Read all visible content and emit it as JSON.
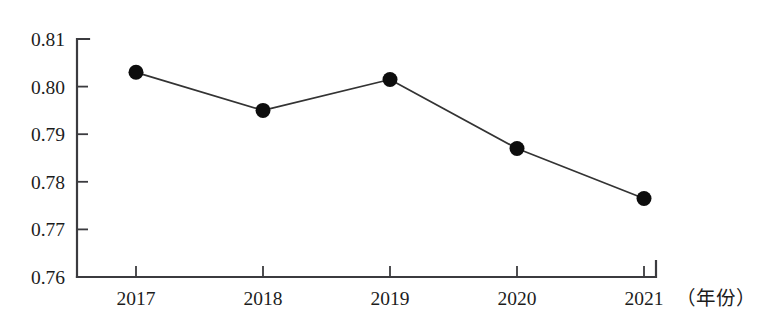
{
  "chart_data": {
    "type": "line",
    "title": "",
    "subtitle": "",
    "xlabel": "（年份）",
    "ylabel": "",
    "categories": [
      "2017",
      "2018",
      "2019",
      "2020",
      "2021"
    ],
    "values": [
      0.803,
      0.795,
      0.8015,
      0.787,
      0.7765
    ],
    "series": [
      {
        "name": "",
        "values": [
          0.803,
          0.795,
          0.8015,
          0.787,
          0.7765
        ]
      }
    ],
    "ylim": [
      0.76,
      0.81
    ],
    "xlim": [
      "2017",
      "2021"
    ],
    "ytick_labels": [
      "0.81",
      "0.80",
      "0.79",
      "0.78",
      "0.77",
      "0.76"
    ],
    "ytick_values": [
      0.81,
      0.8,
      0.79,
      0.78,
      0.77,
      0.76
    ],
    "xtick_labels": [
      "2017",
      "2018",
      "2019",
      "2020",
      "2021"
    ],
    "grid": false,
    "legend": false,
    "legend_position": "none",
    "marker": "filled-circle",
    "line_color": "#333333",
    "marker_color": "#0d0d0d",
    "axis_color": "#3b3b3f",
    "background_color": "#ffffff"
  },
  "axis": {
    "x_caption": "（年份）",
    "y_ticks": [
      {
        "label": "0.81",
        "value": 0.81
      },
      {
        "label": "0.80",
        "value": 0.8
      },
      {
        "label": "0.79",
        "value": 0.79
      },
      {
        "label": "0.78",
        "value": 0.78
      },
      {
        "label": "0.77",
        "value": 0.77
      },
      {
        "label": "0.76",
        "value": 0.76
      }
    ],
    "x_ticks": [
      {
        "label": "2017",
        "value": 2017
      },
      {
        "label": "2018",
        "value": 2018
      },
      {
        "label": "2019",
        "value": 2019
      },
      {
        "label": "2020",
        "value": 2020
      },
      {
        "label": "2021",
        "value": 2021
      }
    ]
  },
  "points": [
    {
      "x_label": "2017",
      "value": 0.803
    },
    {
      "x_label": "2018",
      "value": 0.795
    },
    {
      "x_label": "2019",
      "value": 0.8015
    },
    {
      "x_label": "2020",
      "value": 0.787
    },
    {
      "x_label": "2021",
      "value": 0.7765
    }
  ]
}
